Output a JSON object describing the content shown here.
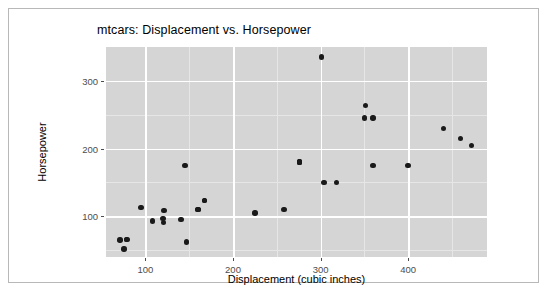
{
  "figure": {
    "title": "mtcars: Displacement vs. Horsepower",
    "panel_color": "#d5d5d5",
    "grid_color": "#ffffff",
    "point_color": "#1a1a1a",
    "border_color": "#b8b8b8"
  },
  "chart_data": {
    "type": "scatter",
    "title": "mtcars: Displacement vs. Horsepower",
    "xlabel": "Displacement (cubic inches)",
    "ylabel": "Horsepower",
    "xlim": [
      55,
      490
    ],
    "ylim": [
      40,
      350
    ],
    "xticks": [
      100,
      200,
      300,
      400
    ],
    "yticks": [
      100,
      200,
      300
    ],
    "xminor": [
      150,
      250,
      350,
      450
    ],
    "yminor": [
      50,
      150,
      250,
      300
    ],
    "grid": true,
    "legend": "none",
    "series": [
      {
        "name": "mtcars",
        "x": [
          160,
          160,
          108,
          258,
          360,
          225,
          360,
          146.7,
          140.8,
          167.6,
          167.6,
          275.8,
          275.8,
          275.8,
          472,
          460,
          440,
          78.7,
          75.7,
          71.1,
          120.1,
          318,
          304,
          350,
          400,
          79,
          120.3,
          95.1,
          351,
          145,
          301,
          121
        ],
        "y": [
          110,
          110,
          93,
          110,
          175,
          105,
          245,
          62,
          95,
          123,
          123,
          180,
          180,
          180,
          205,
          215,
          230,
          66,
          52,
          65,
          97,
          150,
          150,
          245,
          175,
          66,
          91,
          113,
          264,
          175,
          335,
          109
        ]
      }
    ]
  },
  "axes": {
    "x_title": "Displacement (cubic inches)",
    "y_title": "Horsepower",
    "x_tick_labels": [
      "100",
      "200",
      "300",
      "400"
    ],
    "y_tick_labels": [
      "100",
      "200",
      "300"
    ]
  }
}
